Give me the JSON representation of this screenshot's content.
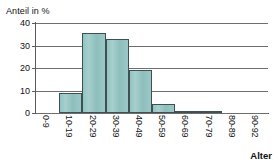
{
  "chart_data": {
    "type": "bar",
    "title": "",
    "subtitle": "",
    "xlabel": "Alter",
    "ylabel": "Anteil in %",
    "categories": [
      "0-9",
      "10-19",
      "20-29",
      "30-39",
      "40-49",
      "50-59",
      "60-69",
      "70-79",
      "80-89",
      "90-92"
    ],
    "values": [
      0,
      8.8,
      35.6,
      33,
      19,
      4.2,
      0.5,
      0.5,
      0,
      0
    ],
    "ylim": [
      0,
      40
    ],
    "yticks": [
      0,
      10,
      20,
      30,
      40
    ],
    "ytick_labels": [
      "0",
      "10",
      "20",
      "30",
      "40"
    ],
    "grid": true,
    "legend": "none",
    "series_color": "#93c4c2",
    "bar_border_color": "#3f4f52",
    "gridline_color": "#6e6e6e",
    "axis_color": "#4a4a4a"
  },
  "axes": {
    "y_title": "Anteil in %",
    "x_title": "Alter"
  }
}
